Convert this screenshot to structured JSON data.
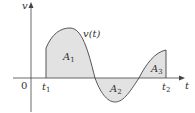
{
  "diagram": {
    "type": "area-under-curve",
    "curve_label": "v(t)",
    "axes": {
      "y_label": "v",
      "x_label": "t",
      "origin_label": "0"
    },
    "ticks": [
      {
        "label": "t",
        "sub": "1"
      },
      {
        "label": "t",
        "sub": "2"
      }
    ],
    "regions": [
      {
        "label": "A",
        "sub": "1",
        "sign": "positive"
      },
      {
        "label": "A",
        "sub": "2",
        "sign": "negative"
      },
      {
        "label": "A",
        "sub": "3",
        "sign": "positive"
      }
    ],
    "colors": {
      "fill": "#e2e2e2",
      "curve": "#555555",
      "axis": "#444444",
      "text": "#333333"
    }
  }
}
